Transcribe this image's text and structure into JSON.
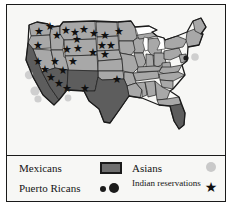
{
  "map": {
    "background_color": "#f7f7f5",
    "state_fill_default": "#a8a8a8",
    "state_fill_highlight": "#5d5d5d",
    "state_border_color": "#1b1b1b",
    "outline_color": "#1b1b1b",
    "lake_color": "#ffffff",
    "states_highlighted": [
      "California",
      "Arizona",
      "New Mexico",
      "Texas",
      "South Florida"
    ],
    "states_default": [
      "Washington",
      "Oregon",
      "Idaho",
      "Montana",
      "North Dakota",
      "Minnesota",
      "Wisconsin",
      "Michigan",
      "Nevada",
      "Utah",
      "Wyoming",
      "South Dakota",
      "Iowa",
      "Illinois",
      "Indiana",
      "Ohio",
      "Colorado",
      "Nebraska",
      "Kansas",
      "Missouri",
      "Kentucky",
      "West Virginia",
      "Virginia",
      "Pennsylvania",
      "New York",
      "Maine",
      "Vermont",
      "New Hampshire",
      "Massachusetts",
      "Connecticut",
      "Rhode Island",
      "New Jersey",
      "Delaware",
      "Maryland",
      "Oklahoma",
      "Arkansas",
      "Tennessee",
      "North Carolina",
      "South Carolina",
      "Georgia",
      "Alabama",
      "Mississippi",
      "Louisiana",
      "Florida"
    ]
  },
  "markers": {
    "asian_circle_color": "#cfcfcf",
    "puerto_rican_dot_color": "#1b1b1b",
    "indian_reservation_star_color": "#101010",
    "star_glyph": "★",
    "indian_reservation_star_count": 27,
    "asian_circle_count": 5,
    "puerto_rican_dot_count": 1
  },
  "legend": {
    "rows": [
      {
        "left_label": "Mexicans",
        "left_symbol": "filled-rectangle",
        "right_label": "Asians",
        "right_symbol": "light-gray-circle"
      },
      {
        "left_label": "Puerto Ricans",
        "left_symbol": "two-black-dots",
        "right_label": "Indian reservations",
        "right_symbol": "black-star"
      }
    ],
    "mexicans_label": "Mexicans",
    "puerto_ricans_label": "Puerto Ricans",
    "asians_label": "Asians",
    "indian_reservations_label": "Indian reservations",
    "star_glyph": "★"
  },
  "colors": {
    "frame": "#1a1a1a",
    "panel_background": "#f7f7f5",
    "text": "#141414"
  }
}
